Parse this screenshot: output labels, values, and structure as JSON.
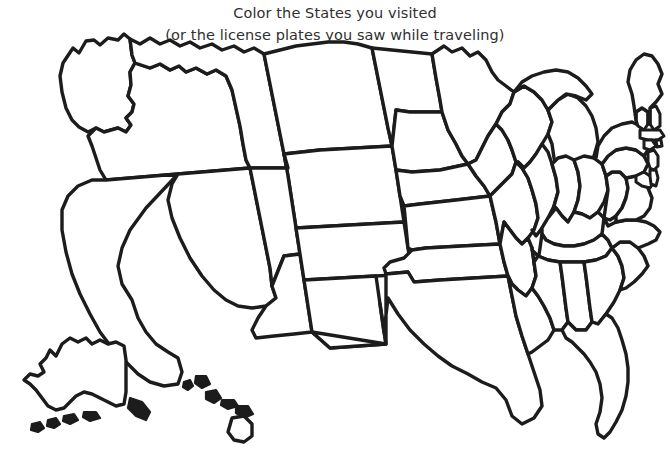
{
  "page": {
    "width": 670,
    "height": 465,
    "background_color": "#ffffff",
    "ink_color": "#1c1c1c",
    "text_color": "#303030",
    "kind": "printable coloring-page map"
  },
  "caption": {
    "line1": "Color the States you visited",
    "line2": "(or the license plates you saw while traveling)"
  },
  "map": {
    "name": "blank-united-states-outline-map",
    "title": "United States",
    "style": "thick black hand-drawn outlines, white (uncolored) interiors",
    "includes_insets": [
      "Alaska",
      "Hawaii"
    ],
    "regions": [
      {
        "code": "WA",
        "name": "Washington"
      },
      {
        "code": "OR",
        "name": "Oregon"
      },
      {
        "code": "CA",
        "name": "California"
      },
      {
        "code": "NV",
        "name": "Nevada"
      },
      {
        "code": "ID",
        "name": "Idaho"
      },
      {
        "code": "MT",
        "name": "Montana"
      },
      {
        "code": "WY",
        "name": "Wyoming"
      },
      {
        "code": "UT",
        "name": "Utah"
      },
      {
        "code": "AZ",
        "name": "Arizona"
      },
      {
        "code": "CO",
        "name": "Colorado"
      },
      {
        "code": "NM",
        "name": "New Mexico"
      },
      {
        "code": "ND",
        "name": "North Dakota"
      },
      {
        "code": "SD",
        "name": "South Dakota"
      },
      {
        "code": "NE",
        "name": "Nebraska"
      },
      {
        "code": "KS",
        "name": "Kansas"
      },
      {
        "code": "OK",
        "name": "Oklahoma"
      },
      {
        "code": "TX",
        "name": "Texas"
      },
      {
        "code": "MN",
        "name": "Minnesota"
      },
      {
        "code": "IA",
        "name": "Iowa"
      },
      {
        "code": "MO",
        "name": "Missouri"
      },
      {
        "code": "AR",
        "name": "Arkansas"
      },
      {
        "code": "LA",
        "name": "Louisiana"
      },
      {
        "code": "WI",
        "name": "Wisconsin"
      },
      {
        "code": "IL",
        "name": "Illinois"
      },
      {
        "code": "MI",
        "name": "Michigan"
      },
      {
        "code": "IN",
        "name": "Indiana"
      },
      {
        "code": "OH",
        "name": "Ohio"
      },
      {
        "code": "KY",
        "name": "Kentucky"
      },
      {
        "code": "TN",
        "name": "Tennessee"
      },
      {
        "code": "MS",
        "name": "Mississippi"
      },
      {
        "code": "AL",
        "name": "Alabama"
      },
      {
        "code": "GA",
        "name": "Georgia"
      },
      {
        "code": "FL",
        "name": "Florida"
      },
      {
        "code": "SC",
        "name": "South Carolina"
      },
      {
        "code": "NC",
        "name": "North Carolina"
      },
      {
        "code": "VA",
        "name": "Virginia"
      },
      {
        "code": "WV",
        "name": "West Virginia"
      },
      {
        "code": "MD",
        "name": "Maryland"
      },
      {
        "code": "DE",
        "name": "Delaware"
      },
      {
        "code": "PA",
        "name": "Pennsylvania"
      },
      {
        "code": "NJ",
        "name": "New Jersey"
      },
      {
        "code": "NY",
        "name": "New York"
      },
      {
        "code": "CT",
        "name": "Connecticut"
      },
      {
        "code": "RI",
        "name": "Rhode Island"
      },
      {
        "code": "MA",
        "name": "Massachusetts"
      },
      {
        "code": "VT",
        "name": "Vermont"
      },
      {
        "code": "NH",
        "name": "New Hampshire"
      },
      {
        "code": "ME",
        "name": "Maine"
      },
      {
        "code": "AK",
        "name": "Alaska"
      },
      {
        "code": "HI",
        "name": "Hawaii"
      }
    ]
  }
}
